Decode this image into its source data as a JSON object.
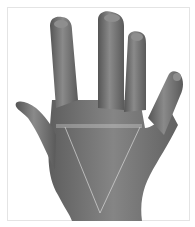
{
  "image": {
    "subject": "back of a hand with fingers spread",
    "style": "grayscale photograph",
    "overlay": {
      "horizontal_line": "across knuckle line",
      "triangle": "V-shape from knuckle line converging toward wrist",
      "line_color": "#d8d8d8"
    },
    "colors": {
      "background": "#ffffff",
      "frame": "#e4e4e4",
      "skin_dark": "#5a5a5a",
      "skin_mid": "#7a7a7a",
      "skin_light": "#959595"
    }
  }
}
